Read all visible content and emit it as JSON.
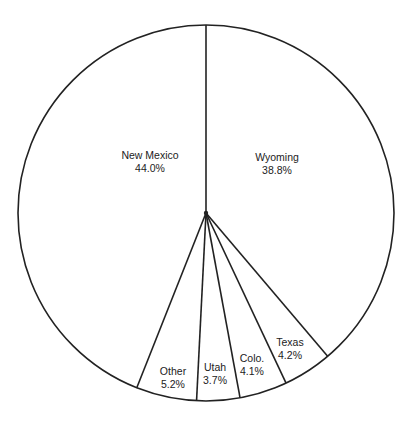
{
  "chart_data": {
    "type": "pie",
    "title": "",
    "start_angle_deg": 0,
    "direction": "clockwise",
    "slices": [
      {
        "label": "Wyoming",
        "value": 38.8,
        "value_label": "38.8%"
      },
      {
        "label": "Texas",
        "value": 4.2,
        "value_label": "4.2%"
      },
      {
        "label": "Colo.",
        "value": 4.1,
        "value_label": "4.1%"
      },
      {
        "label": "Utah",
        "value": 3.7,
        "value_label": "3.7%"
      },
      {
        "label": "Other",
        "value": 5.2,
        "value_label": "5.2%"
      },
      {
        "label": "New Mexico",
        "value": 44.0,
        "value_label": "44.0%"
      }
    ],
    "fill_color": "#ffffff",
    "stroke_color": "#222222",
    "legend": "none"
  },
  "labels": {
    "wyoming": {
      "name": "Wyoming",
      "pct": "38.8%"
    },
    "texas": {
      "name": "Texas",
      "pct": "4.2%"
    },
    "colo": {
      "name": "Colo.",
      "pct": "4.1%"
    },
    "utah": {
      "name": "Utah",
      "pct": "3.7%"
    },
    "other": {
      "name": "Other",
      "pct": "5.2%"
    },
    "new_mexico": {
      "name": "New Mexico",
      "pct": "44.0%"
    }
  }
}
